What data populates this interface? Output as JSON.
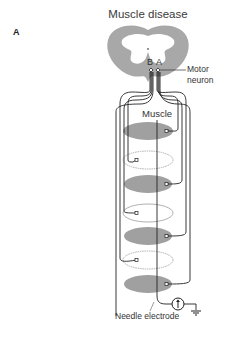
{
  "figure": {
    "panel_label": "A",
    "title": "Muscle disease",
    "labels": {
      "neuron_b": "B",
      "neuron_a": "A",
      "motor_neuron": "Motor neuron",
      "muscle": "Muscle",
      "needle_electrode": "Needle electrode"
    },
    "colors": {
      "gray_matter_fill": "#a8a8a8",
      "healthy_fiber_fill": "#a0a0a0",
      "diseased_fiber_outline": "#b0b0b0",
      "wire": "#222222"
    },
    "muscle_fibers": [
      {
        "index": 1,
        "state": "healthy",
        "innervated_by": "A"
      },
      {
        "index": 2,
        "state": "diseased",
        "innervated_by": "B"
      },
      {
        "index": 3,
        "state": "healthy",
        "innervated_by": "A"
      },
      {
        "index": 4,
        "state": "diseased",
        "innervated_by": "B"
      },
      {
        "index": 5,
        "state": "healthy",
        "innervated_by": "A"
      },
      {
        "index": 6,
        "state": "diseased",
        "innervated_by": "B"
      },
      {
        "index": 7,
        "state": "healthy",
        "innervated_by": "A"
      }
    ],
    "icons": [
      "amplifier-icon",
      "ground-icon"
    ]
  }
}
